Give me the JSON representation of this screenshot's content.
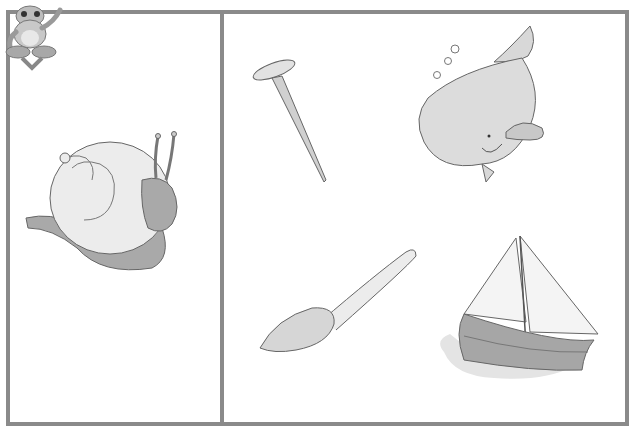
{
  "worksheet": {
    "title": "Picture matching worksheet",
    "mascot": "frog-mascot",
    "colors": {
      "border": "#8a8a8a",
      "fill_light": "#e6e6e6",
      "fill_mid": "#a8a8a8",
      "line": "#555555"
    },
    "left_panel": {
      "items": [
        {
          "name": "snail",
          "label": "snail"
        }
      ]
    },
    "right_panel": {
      "items": [
        {
          "name": "nail",
          "label": "nail"
        },
        {
          "name": "whale",
          "label": "whale"
        },
        {
          "name": "spoon",
          "label": "spoon"
        },
        {
          "name": "sailboat",
          "label": "sailboat"
        }
      ]
    }
  }
}
